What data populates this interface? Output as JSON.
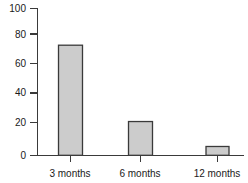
{
  "chart_data": {
    "type": "bar",
    "title": "",
    "subtitle": "",
    "xlabel": "",
    "ylabel": "",
    "categories": [
      "3 months",
      "6 months",
      "12 months"
    ],
    "values": [
      75,
      23,
      6
    ],
    "series": [
      {
        "name": "",
        "values": [
          75,
          23,
          6
        ]
      }
    ],
    "ylim": [
      0,
      100
    ],
    "ytick_labels": [
      "0",
      "20",
      "40",
      "60",
      "80",
      "100"
    ],
    "ytick_values": [
      0,
      20,
      40,
      60,
      80,
      100
    ],
    "grid": false,
    "legend": false,
    "legend_position": "none",
    "colors": {
      "bar_fill": "#cccccc",
      "bar_stroke": "#3a3a3a",
      "axis": "#3a3a3a",
      "text": "#1a1a1a",
      "background": "#ffffff"
    }
  },
  "axis": {
    "y": {
      "ticks": [
        {
          "label": "100",
          "value": 100
        },
        {
          "label": "80",
          "value": 80
        },
        {
          "label": "60",
          "value": 60
        },
        {
          "label": "40",
          "value": 40
        },
        {
          "label": "20",
          "value": 20
        },
        {
          "label": "0",
          "value": 0
        }
      ]
    },
    "x": {
      "ticks": [
        {
          "label": "3 months",
          "value": 75
        },
        {
          "label": "6 months",
          "value": 23
        },
        {
          "label": "12 months",
          "value": 6
        }
      ]
    }
  }
}
